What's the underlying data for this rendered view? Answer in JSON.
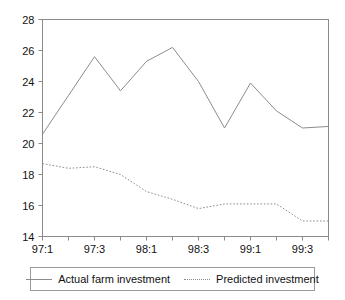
{
  "chart_data": {
    "type": "line",
    "title": "",
    "xlabel": "",
    "ylabel": "",
    "ylim": [
      14,
      28
    ],
    "yticks": [
      14,
      16,
      18,
      20,
      22,
      24,
      26,
      28
    ],
    "ytick_labels": [
      "14",
      "16",
      "18",
      "20",
      "22",
      "24",
      "26",
      "28"
    ],
    "x": [
      "97:1",
      "97:2",
      "97:3",
      "97:4",
      "98:1",
      "98:2",
      "98:3",
      "98:4",
      "99:1",
      "99:2",
      "99:3",
      "99:4"
    ],
    "xticks": [
      "97:1",
      "97:3",
      "98:1",
      "98:3",
      "99:1",
      "99:3"
    ],
    "xtick_positions": [
      0,
      2,
      4,
      6,
      8,
      10
    ],
    "grid": false,
    "legend_position": "below",
    "series": [
      {
        "name": "Actual farm investment",
        "style": "solid",
        "color": "#8c8c8c",
        "values": [
          20.6,
          23.1,
          25.6,
          23.4,
          25.3,
          26.2,
          24.0,
          21.0,
          23.9,
          22.1,
          21.0,
          21.1
        ]
      },
      {
        "name": "Predicted investment",
        "style": "dotted",
        "color": "#8c8c8c",
        "values": [
          18.7,
          18.4,
          18.5,
          18.0,
          16.9,
          16.4,
          15.8,
          16.1,
          16.1,
          16.1,
          15.0,
          15.0
        ]
      }
    ]
  },
  "legend": {
    "entries": [
      {
        "label": "Actual farm investment",
        "style": "solid"
      },
      {
        "label": "Predicted investment",
        "style": "dotted"
      }
    ]
  },
  "colors": {
    "axis": "#8a8a8a",
    "series": "#8c8c8c",
    "text": "#111111",
    "background": "#ffffff"
  }
}
